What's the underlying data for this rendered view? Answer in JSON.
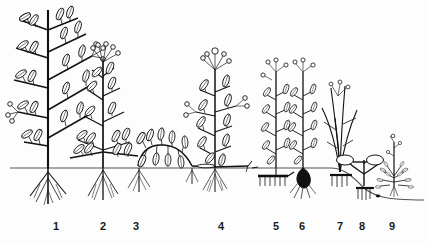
{
  "figure": {
    "kind": "botanical-line-drawing",
    "background_color": "#fdfdfd",
    "ink_color": "#111111",
    "ground_line_color": "#555555",
    "ground_line_y": 168
  },
  "labels": [
    {
      "text": "1",
      "x": 56
    },
    {
      "text": "2",
      "x": 103
    },
    {
      "text": "3",
      "x": 136
    },
    {
      "text": "4",
      "x": 221
    },
    {
      "text": "5",
      "x": 276
    },
    {
      "text": "6",
      "x": 302
    },
    {
      "text": "7",
      "x": 340
    },
    {
      "text": "8",
      "x": 362
    },
    {
      "text": "9",
      "x": 392
    }
  ],
  "plants": [
    {
      "id": "1",
      "name": "tall-woody-tree",
      "base_x": 48,
      "height_top": 8,
      "habit": "erect woody trunk with ascending leafy branches",
      "underground": "taproot with fine lateral roots"
    },
    {
      "id": "2",
      "name": "bushy-shrub",
      "base_x": 103,
      "height_top": 52,
      "habit": "low branching shrub, many leafy shoots from base",
      "underground": "fibrous root cluster"
    },
    {
      "id": "3",
      "name": "prostrate-creeper",
      "base_x": 140,
      "height_top": 134,
      "habit": "creeping leafy shoot lying along the soil surface",
      "underground": "short fibrous roots at node"
    },
    {
      "id": "4",
      "name": "erect-herb-with-stolon",
      "base_x": 215,
      "height_top": 64,
      "habit": "erect leafy herb with flowering umbel, horizontal runners at soil level",
      "underground": "fibrous root tuft"
    },
    {
      "id": "5",
      "name": "rhizome-herb",
      "base_x": 276,
      "height_top": 66,
      "habit": "erect leafy shoot",
      "underground": "horizontal rhizome with comb of downward roots"
    },
    {
      "id": "6",
      "name": "bulb-herb",
      "base_x": 303,
      "height_top": 66,
      "habit": "erect leafy shoot",
      "underground": "solid dark bulb with roots"
    },
    {
      "id": "7",
      "name": "grass-tuft",
      "base_x": 340,
      "height_top": 78,
      "habit": "tufted grass-like plant with narrow leaves",
      "underground": "shallow fibrous roots"
    },
    {
      "id": "8",
      "name": "tuber-geophyte",
      "base_x": 364,
      "height_top": 150,
      "habit": "stalked rounded tubers/bulbils at the soil surface",
      "underground": "buried tubers on short stalks"
    },
    {
      "id": "9",
      "name": "small-annual",
      "base_x": 394,
      "height_top": 140,
      "habit": "small annual with slender flowering stem and basal leaf rosette",
      "underground": "tiny fibrous roots"
    }
  ]
}
